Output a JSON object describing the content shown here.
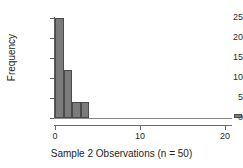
{
  "chart_data": {
    "type": "bar",
    "title": "",
    "subtitle": "",
    "xlabel": "Sample 2 Observations (n = 50)",
    "ylabel": "Frequency",
    "xlim": [
      -0.5,
      22.5
    ],
    "ylim": [
      0,
      25
    ],
    "grid": false,
    "legend": null,
    "xticks": [
      0,
      10,
      20
    ],
    "xtick_labels": [
      "0",
      "10",
      "20"
    ],
    "yticks": [
      0,
      5,
      10,
      15,
      20,
      25
    ],
    "ytick_labels": [
      "0",
      "5",
      "10",
      "15",
      "20",
      "25"
    ],
    "bin_width": 1,
    "categories": [
      "0-1",
      "1-2",
      "2-3",
      "3-4",
      "21-22"
    ],
    "bins": [
      {
        "label": "0-1",
        "x_start": 0,
        "x_end": 1,
        "value": 25
      },
      {
        "label": "1-2",
        "x_start": 1,
        "x_end": 2,
        "value": 12
      },
      {
        "label": "2-3",
        "x_start": 2,
        "x_end": 3,
        "value": 4
      },
      {
        "label": "3-4",
        "x_start": 3,
        "x_end": 4,
        "value": 4
      },
      {
        "label": "21-22",
        "x_start": 21,
        "x_end": 22,
        "value": 1
      }
    ],
    "values": [
      25,
      12,
      4,
      4,
      1
    ],
    "colors": {
      "bar_fill": "#7b7b7b",
      "bar_edge": "#4a4a4a",
      "axis": "#5d5d5d",
      "text": "#1d1d1d",
      "background": "#ffffff"
    }
  }
}
